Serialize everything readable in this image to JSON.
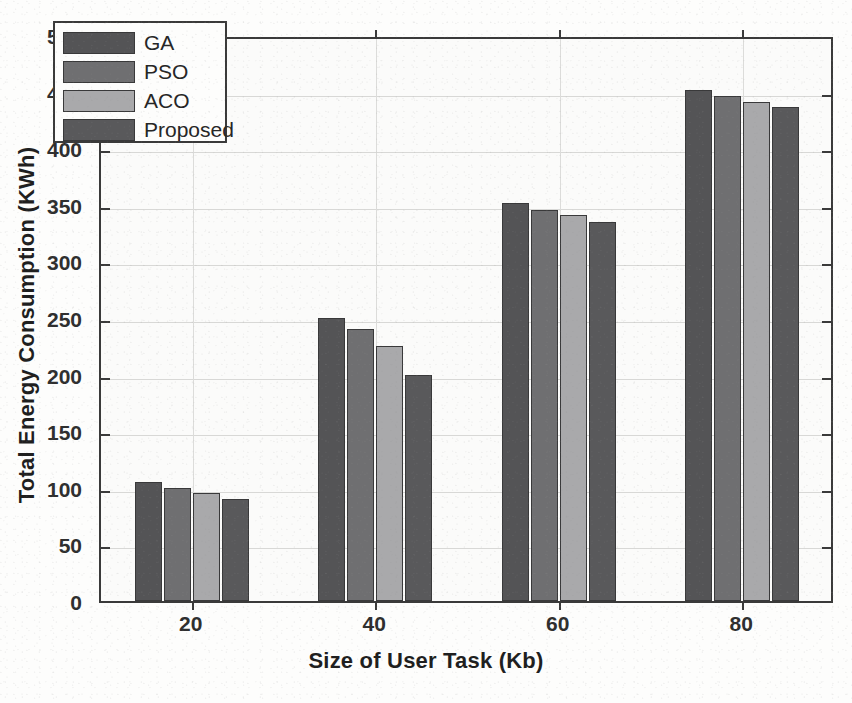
{
  "chart_data": {
    "type": "bar",
    "title": "",
    "xlabel": "Size of User Task (Kb)",
    "ylabel": "Total Energy Consumption (KWh)",
    "categories": [
      "20",
      "40",
      "60",
      "80"
    ],
    "series": [
      {
        "name": "GA",
        "color": "#545456",
        "values": [
          105,
          250,
          352,
          451
        ]
      },
      {
        "name": "PSO",
        "color": "#6f6f71",
        "values": [
          100,
          240,
          345,
          446
        ]
      },
      {
        "name": "ACO",
        "color": "#a9a9ab",
        "values": [
          95,
          225,
          341,
          441
        ]
      },
      {
        "name": "Proposed",
        "color": "#59595b",
        "values": [
          90,
          200,
          335,
          436
        ]
      }
    ],
    "ylim": [
      0,
      500
    ],
    "ytick_step": 50,
    "yticks": [
      "0",
      "50",
      "100",
      "150",
      "200",
      "250",
      "300",
      "350",
      "400",
      "450",
      "500"
    ],
    "grid": true,
    "legend_position": "top-left",
    "axis_color": "#3a3a3a",
    "background_color": "#fbfbfa"
  }
}
